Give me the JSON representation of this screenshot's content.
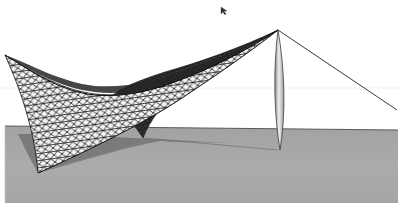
{
  "scene": {
    "title": "Tensile membrane structure rendering",
    "description": "3D render of a hyperbolic-paraboloid tensile membrane canopy with triangulated mesh, supported by a single lens-shaped mast and a back-stay cable, on a gray ground plane with cast shadow",
    "elements": {
      "membrane": "triangulated-mesh-canopy",
      "mast": "lens-shaped-mast",
      "cable": "back-stay-cable",
      "ground": "ground-plane",
      "shadow": "membrane-shadow",
      "cursor": "mouse-cursor"
    },
    "colors": {
      "background": "#ffffff",
      "ground": "#a9a9a9",
      "ground_edge": "#5a5a5a",
      "shadow": "#6e6e6e",
      "membrane_light": "#f2f2f2",
      "membrane_dark": "#3a3a3a",
      "mesh_line": "#111111",
      "mast_fill": "#d0d0d0",
      "mast_outline": "#3c3c3c",
      "cable": "#3a3a3a"
    }
  }
}
